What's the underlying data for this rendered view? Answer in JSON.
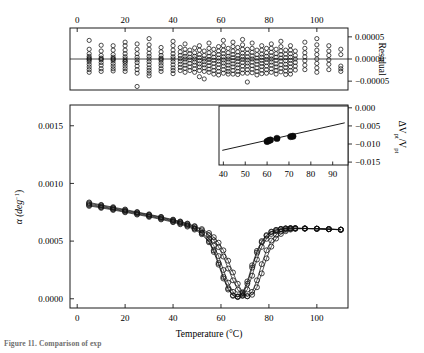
{
  "figure": {
    "caption_fragment": "Figure 11. Comparison of exp",
    "bg_color": "#ffffff",
    "line_color": "#000000"
  },
  "residual_plot": {
    "name": "residual-subplot",
    "y_axis_label": "Residual",
    "x_ticks": [
      0,
      20,
      40,
      60,
      80,
      100
    ],
    "x_tick_labels": [
      "0",
      "20",
      "40",
      "60",
      "80",
      "100"
    ],
    "y_ticks": [
      5e-05,
      0.0,
      -5e-05
    ],
    "y_tick_labels": [
      "0.00005",
      "0.00000",
      "-0.00005"
    ],
    "xlim": [
      -3,
      113
    ],
    "ylim": [
      -7e-05,
      7e-05
    ],
    "zero_line": 0.0
  },
  "main_plot": {
    "name": "alpha-vs-temperature-plot",
    "x_axis_label": "Temperature (°C)",
    "y_axis_label_main": "α (deg",
    "y_axis_label_exp": "−1",
    "y_axis_label_close": ")",
    "x_ticks": [
      0,
      20,
      40,
      60,
      80,
      100
    ],
    "x_tick_labels": [
      "0",
      "20",
      "40",
      "60",
      "80",
      "100"
    ],
    "y_ticks": [
      0.0,
      0.0005,
      0.001,
      0.0015
    ],
    "y_tick_labels": [
      "0.0000",
      "0.0005",
      "0.0010",
      "0.0015"
    ],
    "xlim": [
      -3,
      113
    ],
    "ylim": [
      -8e-05,
      0.00168
    ]
  },
  "inset_plot": {
    "name": "volume-change-inset",
    "y_axis_label_delta": "ΔV",
    "y_axis_label_sub1": "pt",
    "y_axis_label_div": "/V",
    "y_axis_label_sub2": "pt",
    "x_ticks": [
      40,
      50,
      60,
      70,
      80,
      90
    ],
    "x_tick_labels": [
      "40",
      "50",
      "60",
      "70",
      "80",
      "90"
    ],
    "y_ticks": [
      0.0,
      -0.005,
      -0.01,
      -0.015
    ],
    "y_tick_labels": [
      "0.000",
      "-0.005",
      "-0.010",
      "-0.015"
    ],
    "xlim": [
      38,
      97
    ],
    "ylim": [
      -0.0158,
      0.0005
    ]
  },
  "chart_data": [
    {
      "type": "scatter",
      "name": "residuals",
      "title": "",
      "xlabel": "",
      "ylabel": "Residual",
      "xlim": [
        -3,
        113
      ],
      "ylim": [
        -7e-05,
        7e-05
      ],
      "grid": false,
      "marker": "open-circle",
      "x": [
        5,
        5,
        5,
        5,
        5,
        5,
        5,
        5,
        5,
        5,
        5,
        5,
        10,
        10,
        10,
        10,
        10,
        10,
        10,
        10,
        10,
        10,
        15,
        15,
        15,
        15,
        15,
        15,
        15,
        15,
        15,
        15,
        15,
        20,
        20,
        20,
        20,
        20,
        20,
        20,
        20,
        20,
        20,
        20,
        20,
        25,
        25,
        25,
        25,
        25,
        25,
        25,
        25,
        25,
        25,
        30,
        30,
        30,
        30,
        30,
        30,
        30,
        30,
        30,
        30,
        30,
        30,
        35,
        35,
        35,
        35,
        35,
        35,
        35,
        35,
        35,
        35,
        40,
        40,
        40,
        40,
        40,
        40,
        40,
        40,
        40,
        40,
        40,
        43,
        43,
        43,
        43,
        43,
        43,
        43,
        43,
        45,
        45,
        45,
        45,
        45,
        45,
        45,
        45,
        45,
        47,
        47,
        47,
        47,
        47,
        47,
        47,
        49,
        49,
        49,
        49,
        49,
        49,
        49,
        49,
        51,
        51,
        51,
        51,
        51,
        51,
        51,
        51,
        51,
        53,
        53,
        53,
        53,
        53,
        53,
        53,
        53,
        55,
        55,
        55,
        55,
        55,
        55,
        55,
        55,
        55,
        57,
        57,
        57,
        57,
        57,
        57,
        57,
        57,
        59,
        59,
        59,
        59,
        59,
        59,
        59,
        59,
        59,
        61,
        61,
        61,
        61,
        61,
        61,
        61,
        61,
        61,
        61,
        63,
        63,
        63,
        63,
        63,
        63,
        63,
        63,
        63,
        65,
        65,
        65,
        65,
        65,
        65,
        65,
        65,
        65,
        65,
        67,
        67,
        67,
        67,
        67,
        67,
        67,
        67,
        67,
        69,
        69,
        69,
        69,
        69,
        69,
        69,
        69,
        69,
        69,
        71,
        71,
        71,
        71,
        71,
        71,
        71,
        71,
        71,
        73,
        73,
        73,
        73,
        73,
        73,
        73,
        73,
        73,
        75,
        75,
        75,
        75,
        75,
        75,
        75,
        75,
        77,
        77,
        77,
        77,
        77,
        77,
        77,
        77,
        77,
        79,
        79,
        79,
        79,
        79,
        79,
        79,
        79,
        81,
        81,
        81,
        81,
        81,
        81,
        81,
        81,
        81,
        83,
        83,
        83,
        83,
        83,
        83,
        83,
        83,
        85,
        85,
        85,
        85,
        85,
        85,
        85,
        85,
        85,
        87,
        87,
        87,
        87,
        87,
        87,
        87,
        87,
        89,
        89,
        89,
        89,
        89,
        89,
        89,
        89,
        89,
        91,
        91,
        91,
        91,
        91,
        91,
        95,
        95,
        95,
        95,
        95,
        95,
        95,
        100,
        100,
        100,
        100,
        100,
        100,
        100,
        100,
        105,
        105,
        105,
        105,
        105,
        105,
        110,
        110,
        110,
        110,
        110
      ],
      "y": [
        4.2e-05,
        2.2e-05,
        1.2e-05,
        6e-06,
        2e-06,
        -2e-06,
        -6e-06,
        -1.2e-05,
        -1.8e-05,
        -2.4e-05,
        -3e-05,
        0.0,
        3.1e-05,
        1.8e-05,
        8e-06,
        2e-06,
        -2e-06,
        -8e-06,
        -1.4e-05,
        -2.2e-05,
        -2.8e-05,
        0.0,
        3e-05,
        2e-05,
        1e-05,
        4e-06,
        0.0,
        -4e-06,
        -1e-05,
        -1.6e-05,
        -2.2e-05,
        -2.7e-05,
        0.0,
        3.8e-05,
        3e-05,
        2e-05,
        1.2e-05,
        5e-06,
        0.0,
        -5e-06,
        -1e-05,
        -1.6e-05,
        -2.2e-05,
        -2.8e-05,
        -5e-06,
        3.4e-05,
        2.2e-05,
        1.2e-05,
        4e-06,
        -2e-06,
        -8e-06,
        -1.6e-05,
        -2.4e-05,
        -3.2e-05,
        -6.2e-05,
        4.6e-05,
        3.2e-05,
        2.2e-05,
        1.3e-05,
        6e-06,
        0.0,
        -6e-06,
        -1.3e-05,
        -2e-05,
        -2.6e-05,
        -3.2e-05,
        -3.8e-05,
        2.6e-05,
        1.6e-05,
        8e-06,
        2e-06,
        -3e-06,
        -9e-06,
        -1.5e-05,
        -2.2e-05,
        -2.8e-05,
        0.0,
        4e-05,
        3e-05,
        2e-05,
        1.2e-05,
        5e-06,
        0.0,
        -6e-06,
        -1.3e-05,
        -2e-05,
        -2.6e-05,
        -3.3e-05,
        2.6e-05,
        1.6e-05,
        8e-06,
        1e-06,
        -5e-06,
        -1.2e-05,
        -1.9e-05,
        -2.6e-05,
        3.4e-05,
        2.2e-05,
        1.3e-05,
        6e-06,
        0.0,
        -7e-06,
        -1.4e-05,
        -2.1e-05,
        -3e-05,
        2e-05,
        1.2e-05,
        4e-06,
        -2e-06,
        -1e-05,
        -1.8e-05,
        -2.6e-05,
        2.5e-05,
        1.4e-05,
        6e-06,
        0.0,
        -7e-06,
        -1.4e-05,
        -2.2e-05,
        -3e-05,
        3e-05,
        2e-05,
        1e-05,
        3e-06,
        -4e-06,
        -1.1e-05,
        -1.8e-05,
        -2.6e-05,
        -4e-05,
        1.8e-05,
        8e-06,
        0.0,
        -6e-06,
        -1.3e-05,
        -2e-05,
        -2.8e-05,
        -4.5e-05,
        3.6e-05,
        2.4e-05,
        1.4e-05,
        6e-06,
        -1e-06,
        -8e-06,
        -1.5e-05,
        -2.3e-05,
        -3e-05,
        2.2e-05,
        1.2e-05,
        4e-06,
        -3e-06,
        -1e-05,
        -1.8e-05,
        -2.6e-05,
        -3.4e-05,
        2.8e-05,
        1.8e-05,
        1e-05,
        2e-06,
        -5e-06,
        -1.2e-05,
        -2e-05,
        -2.8e-05,
        -3.6e-05,
        4.2e-05,
        3e-05,
        2e-05,
        1.2e-05,
        5e-06,
        -2e-06,
        -9e-06,
        -1.6e-05,
        -2.4e-05,
        -3.2e-05,
        2.4e-05,
        1.4e-05,
        6e-06,
        0.0,
        -7e-06,
        -1.4e-05,
        -2.1e-05,
        -2.8e-05,
        -3.4e-05,
        3.8e-05,
        2.8e-05,
        1.8e-05,
        1e-05,
        3e-06,
        -4e-06,
        -1.1e-05,
        -1.8e-05,
        -2.6e-05,
        -3.4e-05,
        2.6e-05,
        1.6e-05,
        8e-06,
        1e-06,
        -6e-06,
        -1.3e-05,
        -2e-05,
        -2.8e-05,
        -3.5e-05,
        4.4e-05,
        3.2e-05,
        2.2e-05,
        1.3e-05,
        6e-06,
        -1e-06,
        -8e-06,
        -1.6e-05,
        -2.4e-05,
        -3.2e-05,
        2.2e-05,
        1.3e-05,
        5e-06,
        -2e-06,
        -9e-06,
        -1.6e-05,
        -2.4e-05,
        -3.2e-05,
        -5.2e-05,
        3.6e-05,
        2.4e-05,
        1.5e-05,
        7e-06,
        0.0,
        -7e-06,
        -1.5e-05,
        -2.3e-05,
        -3.1e-05,
        2e-05,
        1e-05,
        2e-06,
        -5e-06,
        -1.2e-05,
        -2e-05,
        -2.8e-05,
        -3.6e-05,
        3e-05,
        2e-05,
        1.1e-05,
        4e-06,
        -3e-06,
        -1e-05,
        -1.7e-05,
        -2.5e-05,
        -3.3e-05,
        2.4e-05,
        1.4e-05,
        6e-06,
        -1e-06,
        -8e-06,
        -1.6e-05,
        -2.4e-05,
        -3.2e-05,
        3.4e-05,
        2.4e-05,
        1.5e-05,
        7e-06,
        0.0,
        -7e-06,
        -1.4e-05,
        -2.2e-05,
        -3e-05,
        2.2e-05,
        1.2e-05,
        4e-06,
        -3e-06,
        -1.1e-05,
        -1.8e-05,
        -2.6e-05,
        -3.4e-05,
        4e-05,
        2.8e-05,
        1.8e-05,
        1e-05,
        2e-06,
        -5e-06,
        -1.3e-05,
        -2.1e-05,
        -2.9e-05,
        2e-05,
        1.1e-05,
        3e-06,
        -4e-06,
        -1.2e-05,
        -1.9e-05,
        -2.7e-05,
        -3.5e-05,
        3e-05,
        2e-05,
        1.2e-05,
        4e-06,
        -3e-06,
        -1e-05,
        -1.8e-05,
        -2.6e-05,
        -3.4e-05,
        1.8e-05,
        8e-06,
        0.0,
        -8e-06,
        -1.6e-05,
        -2.5e-05,
        3.8e-05,
        2.4e-05,
        1.4e-05,
        5e-06,
        -4e-06,
        -1.4e-05,
        -2.4e-05,
        4.6e-05,
        3.2e-05,
        2e-05,
        1e-05,
        0.0,
        -1e-05,
        -2e-05,
        -3e-05,
        3e-05,
        1.8e-05,
        8e-06,
        -2e-06,
        -1.2e-05,
        -2.4e-05,
        2.2e-05,
        1e-05,
        -1.6e-05,
        -2.2e-05,
        -2.8e-05
      ]
    },
    {
      "type": "line",
      "name": "thermal-expansion-curves",
      "title": "",
      "xlabel": "Temperature (°C)",
      "ylabel": "α (deg⁻¹)",
      "xlim": [
        -3,
        113
      ],
      "ylim": [
        -8e-05,
        0.00168
      ],
      "grid": false,
      "marker": "open-circle-with-line",
      "series": [
        {
          "name": "run-1",
          "x": [
            5,
            10,
            15,
            20,
            25,
            30,
            35,
            40,
            43,
            46,
            49,
            52,
            55,
            57,
            59,
            61,
            63,
            65,
            67,
            69,
            71,
            73,
            75,
            77,
            79,
            81,
            83,
            85,
            87,
            89,
            91,
            95,
            100,
            105,
            110
          ],
          "y": [
            0.00082,
            0.0008,
            0.000782,
            0.000762,
            0.000742,
            0.000722,
            0.0007,
            0.000676,
            0.00066,
            0.00064,
            0.000612,
            0.00057,
            0.0005,
            0.00042,
            0.00031,
            0.00019,
            9e-05,
            3e-05,
            1.5e-05,
            4e-05,
            0.00013,
            0.00027,
            0.0004,
            0.00049,
            0.000545,
            0.000578,
            0.000595,
            0.000605,
            0.00061,
            0.000612,
            0.000612,
            0.00061,
            0.000608,
            0.000604,
            0.0006
          ]
        },
        {
          "name": "run-2",
          "x": [
            5,
            10,
            15,
            20,
            25,
            30,
            35,
            40,
            43,
            46,
            49,
            52,
            55,
            57,
            59,
            61,
            63,
            65,
            67,
            69,
            71,
            73,
            75,
            77,
            79,
            81,
            83,
            85,
            87,
            89,
            91,
            95,
            100,
            105,
            110
          ],
          "y": [
            0.000812,
            0.000794,
            0.000776,
            0.000756,
            0.000736,
            0.000716,
            0.000694,
            0.00067,
            0.000654,
            0.000634,
            0.000608,
            0.000572,
            0.00052,
            0.00046,
            0.00037,
            0.00025,
            0.00014,
            6e-05,
            2e-05,
            2.5e-05,
            8e-05,
            0.0002,
            0.00034,
            0.00045,
            0.00052,
            0.000562,
            0.000586,
            0.0006,
            0.000607,
            0.00061,
            0.000611,
            0.000609,
            0.000607,
            0.000603,
            0.000599
          ]
        },
        {
          "name": "run-3",
          "x": [
            5,
            10,
            15,
            20,
            25,
            30,
            35,
            40,
            43,
            46,
            49,
            52,
            55,
            57,
            59,
            61,
            63,
            65,
            67,
            69,
            71,
            73,
            75,
            77,
            79,
            81,
            83,
            85,
            87,
            89,
            91,
            95,
            100,
            105,
            110
          ],
          "y": [
            0.000828,
            0.000808,
            0.000788,
            0.000768,
            0.000748,
            0.000728,
            0.000706,
            0.000682,
            0.000666,
            0.000648,
            0.000624,
            0.000594,
            0.000552,
            0.000508,
            0.000448,
            0.000366,
            0.000262,
            0.00016,
            7.8e-05,
            3e-05,
            2.2e-05,
            6e-05,
            0.00016,
            0.0003,
            0.00042,
            0.000505,
            0.000555,
            0.000583,
            0.000598,
            0.000606,
            0.000609,
            0.000609,
            0.000607,
            0.000603,
            0.000598
          ]
        },
        {
          "name": "run-4",
          "x": [
            5,
            10,
            15,
            20,
            25,
            30,
            35,
            40,
            43,
            46,
            49,
            52,
            55,
            57,
            59,
            61,
            63,
            65,
            67,
            69,
            71,
            73,
            75,
            77,
            79,
            81,
            83,
            85,
            87,
            89,
            91,
            95,
            100,
            105,
            110
          ],
          "y": [
            0.000805,
            0.000788,
            0.00077,
            0.00075,
            0.00073,
            0.00071,
            0.000688,
            0.000664,
            0.000646,
            0.000626,
            0.0006,
            0.00056,
            0.00049,
            0.000406,
            0.000296,
            0.000176,
            8e-05,
            2.6e-05,
            1.8e-05,
            5e-05,
            0.00015,
            0.00029,
            0.000415,
            0.0005,
            0.000552,
            0.000582,
            0.000597,
            0.000606,
            0.00061,
            0.000612,
            0.000612,
            0.00061,
            0.000608,
            0.000604,
            0.0006
          ]
        },
        {
          "name": "run-5",
          "x": [
            5,
            10,
            15,
            20,
            25,
            30,
            35,
            40,
            43,
            46,
            49,
            52,
            55,
            57,
            59,
            61,
            63,
            65,
            67,
            69,
            71,
            73,
            75,
            77,
            79,
            81,
            83,
            85,
            87,
            89,
            91,
            95,
            100,
            105,
            110
          ],
          "y": [
            0.000835,
            0.000814,
            0.000794,
            0.000774,
            0.000752,
            0.000732,
            0.00071,
            0.000686,
            0.00067,
            0.000652,
            0.00063,
            0.000604,
            0.00057,
            0.000534,
            0.000486,
            0.00042,
            0.00033,
            0.000228,
            0.00013,
            5.6e-05,
            2.2e-05,
            3.5e-05,
            0.0001,
            0.00022,
            0.00035,
            0.000452,
            0.000522,
            0.000562,
            0.000586,
            0.0006,
            0.000606,
            0.000608,
            0.000607,
            0.000603,
            0.000598
          ]
        }
      ]
    },
    {
      "type": "scatter",
      "name": "volume-change-inset",
      "title": "",
      "xlabel": "",
      "ylabel": "ΔVpt/Vpt",
      "xlim": [
        38,
        97
      ],
      "ylim": [
        -0.0158,
        0.0005
      ],
      "grid": false,
      "marker": "filled-circle",
      "x": [
        60.0,
        60.8,
        61.5,
        64.5,
        70.8,
        71.8
      ],
      "y": [
        -0.0093,
        -0.00905,
        -0.0089,
        -0.00845,
        -0.00795,
        -0.00785
      ],
      "fit_line": {
        "name": "linear-fit",
        "x": [
          39.5,
          95.5
        ],
        "y": [
          -0.01175,
          -0.00415
        ]
      }
    }
  ]
}
